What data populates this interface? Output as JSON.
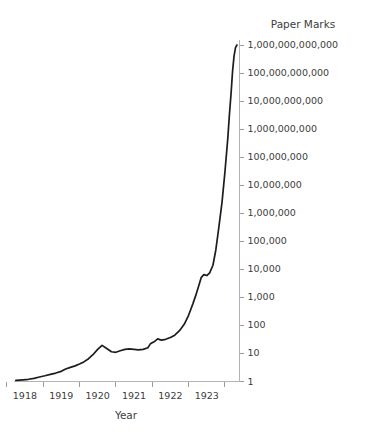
{
  "chart_data": {
    "type": "line",
    "title": "Paper Marks",
    "xlabel": "Year",
    "ylabel": "Paper Marks",
    "yscale": "log",
    "ylim": [
      1,
      1000000000000
    ],
    "xlim": [
      1917.7,
      1923.9
    ],
    "grid": false,
    "legend": null,
    "ytick_labels": [
      "1,000,000,000,000",
      "100,000,000,000",
      "10,000,000,000",
      "1,000,000,000",
      "100,000,000",
      "10,000,000",
      "1,000,000",
      "100,000",
      "10,000",
      "1,000",
      "100",
      "10",
      "1"
    ],
    "ytick_values": [
      1000000000000,
      100000000000,
      10000000000,
      1000000000,
      100000000,
      10000000,
      1000000,
      100000,
      10000,
      1000,
      100,
      10,
      1
    ],
    "xtick_labels": [
      "1918",
      "1919",
      "1920",
      "1921",
      "1922",
      "1923"
    ],
    "xtick_values": [
      1918,
      1919,
      1920,
      1921,
      1922,
      1923
    ],
    "series": [
      {
        "name": "Paper Marks per Gold Mark",
        "color": "#1d1d1d",
        "x": [
          1917.75,
          1917.95,
          1918.1,
          1918.25,
          1918.4,
          1918.55,
          1918.7,
          1918.85,
          1919.0,
          1919.12,
          1919.25,
          1919.38,
          1919.5,
          1919.62,
          1919.75,
          1919.87,
          1920.0,
          1920.12,
          1920.25,
          1920.38,
          1920.5,
          1920.62,
          1920.75,
          1920.87,
          1921.0,
          1921.12,
          1921.25,
          1921.38,
          1921.45,
          1921.55,
          1921.65,
          1921.75,
          1921.87,
          1922.0,
          1922.12,
          1922.25,
          1922.38,
          1922.5,
          1922.62,
          1922.7,
          1922.78,
          1922.85,
          1922.92,
          1923.0,
          1923.08,
          1923.17,
          1923.25,
          1923.33,
          1923.42,
          1923.5,
          1923.58,
          1923.62,
          1923.67,
          1923.71,
          1923.75,
          1923.79,
          1923.83
        ],
        "y": [
          1.1,
          1.15,
          1.2,
          1.3,
          1.45,
          1.6,
          1.8,
          2.0,
          2.3,
          2.8,
          3.2,
          3.6,
          4.2,
          5.0,
          6.5,
          9.0,
          14.0,
          19.5,
          15.0,
          11.5,
          11.0,
          12.5,
          14.0,
          14.5,
          14.0,
          13.5,
          14.0,
          16.0,
          22.0,
          26.0,
          33.0,
          30.0,
          32.0,
          37.0,
          45.0,
          65.0,
          110.0,
          230.0,
          600.0,
          1200.0,
          2600.0,
          5200.0,
          6500.0,
          6000.0,
          7500.0,
          14000.0,
          50000.0,
          300000.0,
          2500000.0,
          30000000.0,
          500000000.0,
          3000000000.0,
          20000000000.0,
          120000000000.0,
          400000000000.0,
          800000000000.0,
          1000000000000.0
        ]
      }
    ],
    "annotations": []
  },
  "chart": {
    "y_axis_title": "Paper Marks",
    "x_axis_title": "Year"
  }
}
